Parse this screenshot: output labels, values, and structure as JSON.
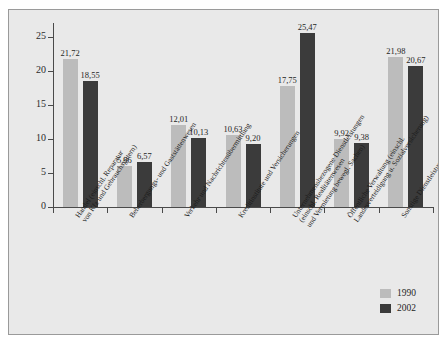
{
  "chart_data": {
    "type": "bar",
    "title": "",
    "subtitle": "",
    "xlabel": "",
    "ylabel": "",
    "ylim": [
      0,
      27
    ],
    "yticks": [
      0,
      5,
      10,
      15,
      20,
      25
    ],
    "ytick_labels": [
      "0",
      "5",
      "10",
      "15",
      "20",
      "25"
    ],
    "grid": false,
    "legend_position": "bottom-right",
    "decimal_separator": ",",
    "categories": [
      "Handel (einschl. Reparatur von Kfz und Gebrauchsgütern)",
      "Beherbergungs- und Gaststättenwesen",
      "Verkehr und Nachrichtenübermittlung",
      "Kreditinstitute und Versicherungen",
      "Unternehmensbezogene Dienstleistungen (einschl. Realitätenwesen und Vermietung bewegl. Sachen)",
      "Öffentliche Verwaltung (einschl. Landesverteidigung u. Sozialversicherung)",
      "Sonstige Dienstleistungen"
    ],
    "category_lines": [
      [
        "Handel (einschl. Reparatur",
        "von Kfz und Gebrauchsgütern)"
      ],
      [
        "Beherbergungs- und Gaststättenwesen"
      ],
      [
        "Verkehr und Nachrichtenübermittlung"
      ],
      [
        "Kreditinstitute und Versicherungen"
      ],
      [
        "Unternehmensbezogene Dienstleistungen",
        "(einschl. Realitätenwesen",
        "und Vermietung bewegl. Sachen)"
      ],
      [
        "Öffentliche Verwaltung (einschl.",
        "Landesverteidigung u. Sozialversicherung)"
      ],
      [
        "Sonstige Dienstleistungen"
      ]
    ],
    "series": [
      {
        "name": "1990",
        "color": "#bcbcbc",
        "values": [
          21.72,
          5.96,
          12.01,
          10.63,
          17.75,
          9.92,
          21.98
        ],
        "labels": [
          "21,72",
          "5,96",
          "12,01",
          "10,63",
          "17,75",
          "9,92",
          "21,98"
        ]
      },
      {
        "name": "2002",
        "color": "#3b3b3b",
        "values": [
          18.55,
          6.57,
          10.13,
          9.2,
          25.47,
          9.38,
          20.67
        ],
        "labels": [
          "18,55",
          "6,57",
          "10,13",
          "9,20",
          "25,47",
          "9,38",
          "20,67"
        ]
      }
    ]
  },
  "legend": {
    "items": [
      {
        "label": "1990",
        "color": "#bcbcbc"
      },
      {
        "label": "2002",
        "color": "#3b3b3b"
      }
    ]
  },
  "colors": {
    "series_1990": "#bcbcbc",
    "series_2002": "#3b3b3b",
    "background": "#e9e9e9",
    "axis": "#4a4a4a",
    "text": "#1f1f1f"
  }
}
